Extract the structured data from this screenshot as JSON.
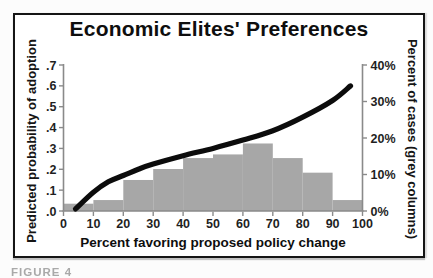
{
  "figure": {
    "caption_fragment": "FIGURE 4",
    "colors": {
      "bar": "#a7a7a7",
      "line": "#0c0c0c",
      "axis": "#8a8a8a",
      "tick_text": "#1f1f1f",
      "frame": "#151515"
    }
  },
  "chart_data": {
    "type": "line+bar",
    "title": "Economic Elites' Preferences",
    "x_axis": {
      "label": "Percent favoring proposed policy change",
      "range": [
        0,
        100
      ],
      "tick_values": [
        0,
        10,
        20,
        30,
        40,
        50,
        60,
        70,
        80,
        90,
        100
      ],
      "tick_labels": [
        "0",
        "10",
        "20",
        "30",
        "40",
        "50",
        "60",
        "70",
        "80",
        "90",
        "100"
      ]
    },
    "left_axis": {
      "label": "Predicted probability of adoption",
      "range": [
        0,
        0.7
      ],
      "tick_values": [
        0.0,
        0.1,
        0.2,
        0.3,
        0.4,
        0.5,
        0.6,
        0.7
      ],
      "tick_labels": [
        ".0",
        ".1",
        ".2",
        ".3",
        ".4",
        ".5",
        ".6",
        ".7"
      ]
    },
    "right_axis": {
      "label": "Percent of cases (grey columns)",
      "range": [
        0,
        40
      ],
      "tick_values": [
        0,
        10,
        20,
        30,
        40
      ],
      "tick_labels": [
        "0%",
        "10%",
        "20%",
        "30%",
        "40%"
      ]
    },
    "bars": {
      "name": "Percent of cases (grey columns)",
      "bins": [
        [
          0,
          10
        ],
        [
          10,
          20
        ],
        [
          20,
          30
        ],
        [
          30,
          40
        ],
        [
          40,
          50
        ],
        [
          50,
          60
        ],
        [
          60,
          70
        ],
        [
          70,
          80
        ],
        [
          80,
          90
        ],
        [
          90,
          100
        ]
      ],
      "values_pct": [
        2,
        3,
        8.5,
        11.5,
        14.5,
        15.5,
        18.5,
        14.5,
        10.5,
        3
      ]
    },
    "line": {
      "name": "Predicted probability of adoption",
      "points": [
        {
          "x": 4,
          "p": 0.01
        },
        {
          "x": 10,
          "p": 0.09
        },
        {
          "x": 15,
          "p": 0.14
        },
        {
          "x": 20,
          "p": 0.17
        },
        {
          "x": 25,
          "p": 0.2
        },
        {
          "x": 30,
          "p": 0.225
        },
        {
          "x": 40,
          "p": 0.265
        },
        {
          "x": 50,
          "p": 0.3
        },
        {
          "x": 60,
          "p": 0.34
        },
        {
          "x": 70,
          "p": 0.385
        },
        {
          "x": 80,
          "p": 0.45
        },
        {
          "x": 90,
          "p": 0.53
        },
        {
          "x": 96,
          "p": 0.6
        }
      ]
    },
    "legend": "none",
    "grid": "off"
  }
}
